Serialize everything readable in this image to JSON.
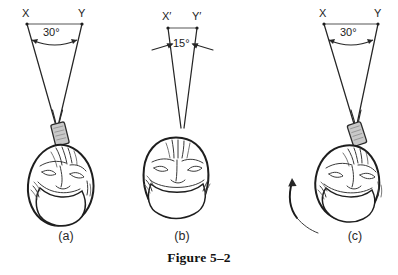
{
  "figure": {
    "caption": "Figure 5–2",
    "background_color": "#ffffff",
    "ink_color": "#1e1e1e",
    "probe_color": "#c9c9c9"
  },
  "panels": [
    {
      "id": "a",
      "sub_caption": "(a)",
      "left_vertex_label": "X",
      "right_vertex_label": "Y",
      "angle_label": "30°",
      "angle_degrees": 30,
      "has_probe": true,
      "has_rotation_arrow": false,
      "has_convergence_arrows": false,
      "head_orientation": "tilted-left",
      "description": "Wide 30 degree scan sector with transducer on vertex of head"
    },
    {
      "id": "b",
      "sub_caption": "(b)",
      "left_vertex_label": "X′",
      "right_vertex_label": "Y′",
      "angle_label": "15°",
      "angle_degrees": 15,
      "has_probe": false,
      "has_rotation_arrow": false,
      "has_convergence_arrows": true,
      "head_orientation": "upright",
      "description": "Narrow 15 degree sector with inward pointing arrows, head upright"
    },
    {
      "id": "c",
      "sub_caption": "(c)",
      "left_vertex_label": "X",
      "right_vertex_label": "Y",
      "angle_label": "30°",
      "angle_degrees": 30,
      "has_probe": true,
      "has_rotation_arrow": true,
      "has_convergence_arrows": false,
      "head_orientation": "rotated",
      "description": "Wide 30 degree sector with transducer and counterclockwise rotation arrow around head"
    }
  ]
}
